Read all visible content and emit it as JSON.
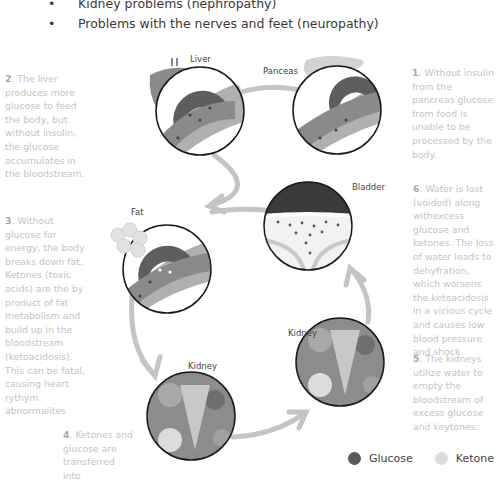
{
  "bullets": [
    "Kidney problems (nephropathy)",
    "Problems with the nerves and feet (neuropathy)"
  ],
  "bullet_glyph": "•",
  "organs": {
    "liver": "Liver",
    "pancreas": "Panceas",
    "bladder": "Bladder",
    "fat": "Fat",
    "kidney_right": "Kidney",
    "kidney_bottom": "Kidney"
  },
  "notes": {
    "n1": {
      "num": "1",
      "text": ". Without insulin from the pancreas glucose from food is unable to be processed by the body."
    },
    "n2": {
      "num": "2",
      "text": ". The liver produces more glucose to feed the body, but without insulin, the glucose accumulates in the bloodstream."
    },
    "n3": {
      "num": "3",
      "text": ". Without glucose for energy, the body breaks down fat. Ketones (toxic acids) are the by product of fat metabolism and build up in the bloodstream (ketoacidosis). This can be fatal, causing heart rythym abnormalites"
    },
    "n4": {
      "num": "4",
      "text": ". Ketones and glucose are transferred into"
    },
    "n5": {
      "num": "5",
      "text": ". The kidneys utilize water to empty the bloodstream of excess glucose and keytones."
    },
    "n6": {
      "num": "6",
      "text": ". Water is lost (voided) along withexcess glucose and ketones. The loss of water leads to dehyfration, which worsens the ketoacidosis in a vicious cycle and causes low blood pressure and shock"
    }
  },
  "legend": [
    {
      "label": "Glucose",
      "color": "#5a5a5a"
    },
    {
      "label": "Ketone",
      "color": "#dcdcdc"
    }
  ],
  "colors": {
    "arrow": "#c4c4c4",
    "circle_stroke": "#1a1a1a",
    "vessel_outer": "#9a9a9a",
    "vessel_inner": "#6e6e6e",
    "text_light": "#c4c4c4"
  }
}
